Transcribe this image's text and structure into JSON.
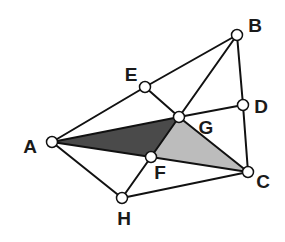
{
  "diagram": {
    "colors": {
      "line": "#111111",
      "vertex_fill": "#ffffff",
      "dark_region": "#4a4a4a",
      "light_region": "#bcbcbc",
      "background": "#ffffff"
    },
    "points": {
      "A": {
        "x": 52,
        "y": 142
      },
      "B": {
        "x": 237,
        "y": 35
      },
      "C": {
        "x": 248,
        "y": 172
      },
      "D": {
        "x": 243,
        "y": 105
      },
      "E": {
        "x": 145,
        "y": 87
      },
      "F": {
        "x": 151,
        "y": 157
      },
      "G": {
        "x": 179,
        "y": 117
      },
      "H": {
        "x": 122,
        "y": 198
      }
    },
    "labels": [
      {
        "text": "A",
        "x": 30,
        "y": 146
      },
      {
        "text": "B",
        "x": 255,
        "y": 25
      },
      {
        "text": "C",
        "x": 263,
        "y": 181
      },
      {
        "text": "D",
        "x": 261,
        "y": 106
      },
      {
        "text": "E",
        "x": 131,
        "y": 74
      },
      {
        "text": "F",
        "x": 160,
        "y": 172
      },
      {
        "text": "G",
        "x": 206,
        "y": 127
      },
      {
        "text": "H",
        "x": 124,
        "y": 218
      }
    ],
    "shaded_regions": [
      {
        "name": "triangle-AGF",
        "vertices": [
          "A",
          "G",
          "F"
        ],
        "shade": "dark"
      },
      {
        "name": "triangle-GFC",
        "vertices": [
          "G",
          "F",
          "C"
        ],
        "shade": "light"
      }
    ],
    "edges": [
      [
        "A",
        "E"
      ],
      [
        "E",
        "B"
      ],
      [
        "B",
        "D"
      ],
      [
        "D",
        "C"
      ],
      [
        "B",
        "G"
      ],
      [
        "E",
        "G"
      ],
      [
        "G",
        "C"
      ],
      [
        "G",
        "D"
      ],
      [
        "A",
        "G"
      ],
      [
        "A",
        "F"
      ],
      [
        "F",
        "C"
      ],
      [
        "H",
        "F"
      ],
      [
        "F",
        "G"
      ],
      [
        "A",
        "H"
      ],
      [
        "H",
        "C"
      ]
    ]
  }
}
